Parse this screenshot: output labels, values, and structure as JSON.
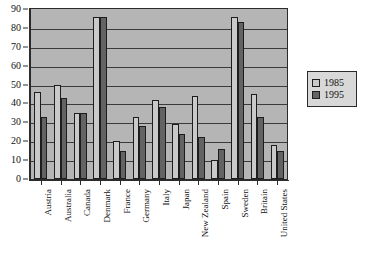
{
  "chart_data": {
    "type": "bar",
    "title": "",
    "xlabel": "",
    "ylabel": "",
    "ylim": [
      0,
      90
    ],
    "ytick_step": 10,
    "yticks": [
      0,
      10,
      20,
      30,
      40,
      50,
      60,
      70,
      80,
      90
    ],
    "grid": true,
    "legend_position": "right",
    "categories": [
      "Austria",
      "Australia",
      "Canada",
      "Denmark",
      "France",
      "Germany",
      "Italy",
      "Japan",
      "New Zealand",
      "Spain",
      "Sweden",
      "Britain",
      "United States"
    ],
    "series": [
      {
        "name": "1985",
        "color": "#c9c9c9",
        "values": [
          46,
          50,
          35,
          86,
          20,
          33,
          42,
          29,
          44,
          10,
          86,
          45,
          18
        ]
      },
      {
        "name": "1995",
        "color": "#636363",
        "values": [
          33,
          43,
          35,
          86,
          15,
          28,
          38,
          24,
          22,
          16,
          83,
          33,
          15
        ]
      }
    ]
  },
  "legend": {
    "items": [
      {
        "label": "1985",
        "swatch": "light-gray-swatch-icon"
      },
      {
        "label": "1995",
        "swatch": "dark-gray-swatch-icon"
      }
    ]
  }
}
